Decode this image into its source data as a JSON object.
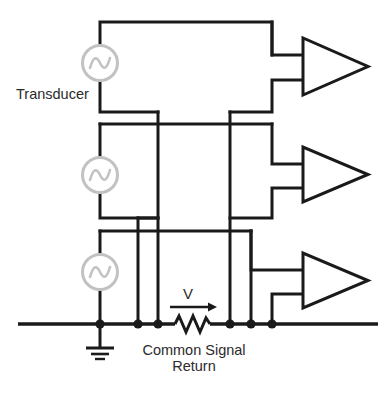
{
  "diagram": {
    "labels": {
      "transducer": "Transducer",
      "voltage": "V",
      "common_signal_line1": "Common Signal",
      "common_signal_line2": "Return"
    },
    "colors": {
      "wire": "#1a1a1a",
      "source_outline": "#c2c2c2",
      "background": "#ffffff",
      "text": "#2b2b2b"
    },
    "components": {
      "sources": [
        {
          "name": "transducer-source-1",
          "cx": 100,
          "cy": 63,
          "r": 18,
          "symbol": "ac-source-sine"
        },
        {
          "name": "transducer-source-2",
          "cx": 100,
          "cy": 175,
          "r": 18,
          "symbol": "ac-source-sine"
        },
        {
          "name": "transducer-source-3",
          "cx": 100,
          "cy": 272,
          "r": 18,
          "symbol": "ac-source-sine"
        }
      ],
      "amplifiers": [
        {
          "name": "amplifier-1",
          "x": 303,
          "y_top": 38,
          "y_bottom": 95,
          "x_tip": 368,
          "symbol": "triangle-amplifier"
        },
        {
          "name": "amplifier-2",
          "x": 303,
          "y_top": 147,
          "y_bottom": 202,
          "x_tip": 368,
          "symbol": "triangle-amplifier"
        },
        {
          "name": "amplifier-3",
          "x": 303,
          "y_top": 253,
          "y_bottom": 308,
          "x_tip": 368,
          "symbol": "triangle-amplifier"
        }
      ],
      "resistor": {
        "name": "return-path-resistor",
        "x1": 175,
        "x2": 210,
        "y": 324,
        "zigzags": 4
      },
      "ground": {
        "name": "earth-ground-symbol",
        "x": 100,
        "y": 324
      },
      "bus": {
        "name": "common-signal-return-bus",
        "x1": 18,
        "x2": 378,
        "y": 324
      },
      "nodes": [
        {
          "name": "bus-node-ground",
          "x": 100,
          "y": 324
        },
        {
          "name": "bus-node-2",
          "x": 138,
          "y": 324
        },
        {
          "name": "bus-node-3",
          "x": 158,
          "y": 324
        },
        {
          "name": "bus-node-4",
          "x": 230,
          "y": 324
        },
        {
          "name": "bus-node-5",
          "x": 251,
          "y": 324
        },
        {
          "name": "bus-node-6",
          "x": 272,
          "y": 324
        }
      ]
    }
  }
}
